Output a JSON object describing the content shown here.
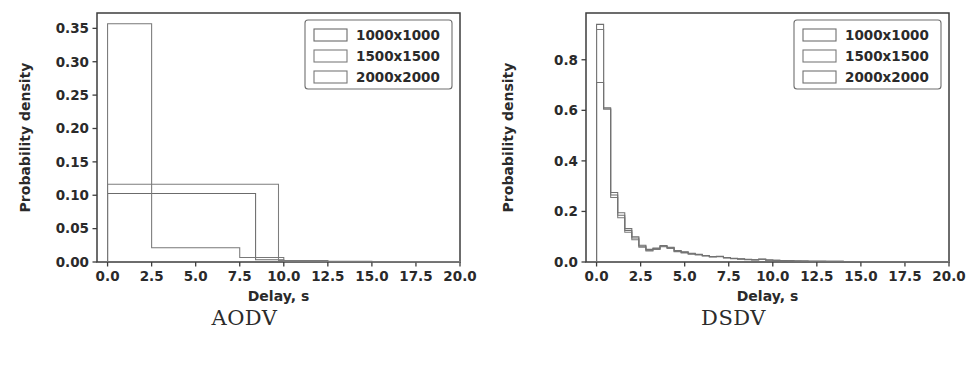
{
  "figure": {
    "background": "#ffffff",
    "panel_count": 2
  },
  "panels": [
    {
      "caption": "AODV",
      "chart_data": {
        "type": "line",
        "subtype": "step-histogram-outline",
        "title": "",
        "xlabel": "Delay, s",
        "ylabel": "Probability density",
        "xlim": [
          -0.6,
          20.0
        ],
        "ylim": [
          0.0,
          0.373
        ],
        "xticks": [
          0.0,
          2.5,
          5.0,
          7.5,
          10.0,
          12.5,
          15.0,
          17.5,
          20.0
        ],
        "xticklabels": [
          "0.0",
          "2.5",
          "5.0",
          "7.5",
          "10.0",
          "12.5",
          "15.0",
          "17.5",
          "20.0"
        ],
        "yticks": [
          0.0,
          0.05,
          0.1,
          0.15,
          0.2,
          0.25,
          0.3,
          0.35
        ],
        "yticklabels": [
          "0.00",
          "0.05",
          "0.10",
          "0.15",
          "0.20",
          "0.25",
          "0.30",
          "0.35"
        ],
        "grid": false,
        "legend_position": "upper right",
        "series": [
          {
            "name": "1000x1000",
            "color": "#6b6b6b",
            "bin_edges": [
              0.0,
              2.5,
              5.0,
              7.5,
              8.4,
              10.0,
              12.5,
              15.0,
              17.5,
              20.0
            ],
            "values": [
              0.1025,
              0.1025,
              0.1025,
              0.1025,
              0.0035,
              0.0012,
              0.0008,
              0.0005,
              0.0004
            ]
          },
          {
            "name": "1500x1500",
            "color": "#7d7d7d",
            "bin_edges": [
              0.0,
              2.5,
              5.0,
              7.5,
              9.7,
              10.0,
              12.5,
              15.0,
              17.5,
              20.0
            ],
            "values": [
              0.1165,
              0.1165,
              0.1165,
              0.1165,
              0.0022,
              0.0012,
              0.0008,
              0.0005,
              0.0003
            ]
          },
          {
            "name": "2000x2000",
            "color": "#787878",
            "bin_edges": [
              0.0,
              2.5,
              5.0,
              7.5,
              10.0,
              12.5,
              15.0,
              17.5,
              20.0
            ],
            "values": [
              0.357,
              0.0215,
              0.0215,
              0.0068,
              0.0022,
              0.0011,
              0.0007,
              0.0004
            ]
          }
        ]
      }
    },
    {
      "caption": "DSDV",
      "chart_data": {
        "type": "line",
        "subtype": "step-histogram-outline",
        "title": "",
        "xlabel": "Delay, s",
        "ylabel": "Probability density",
        "xlim": [
          -0.6,
          20.0
        ],
        "ylim": [
          0.0,
          0.985
        ],
        "xticks": [
          0.0,
          2.5,
          5.0,
          7.5,
          10.0,
          12.5,
          15.0,
          17.5,
          20.0
        ],
        "xticklabels": [
          "0.0",
          "2.5",
          "5.0",
          "7.5",
          "10.0",
          "12.5",
          "15.0",
          "17.5",
          "20.0"
        ],
        "yticks": [
          0.0,
          0.2,
          0.4,
          0.6,
          0.8
        ],
        "yticklabels": [
          "0.0",
          "0.2",
          "0.4",
          "0.6",
          "0.8"
        ],
        "grid": false,
        "legend_position": "upper right",
        "series": [
          {
            "name": "1000x1000",
            "color": "#6f6f6f",
            "bin_edges": [
              0.0,
              0.4,
              0.8,
              1.2,
              1.6,
              2.0,
              2.4,
              2.8,
              3.2,
              3.6,
              4.0,
              4.4,
              4.8,
              5.2,
              5.6,
              6.0,
              6.4,
              6.8,
              7.2,
              7.6,
              8.0,
              8.4,
              8.8,
              9.2,
              9.6,
              10.0,
              10.4,
              10.8,
              11.2,
              11.6,
              12.0,
              13.0,
              14.0,
              15.0,
              16.0,
              18.0,
              20.0
            ],
            "values": [
              0.94,
              0.61,
              0.265,
              0.185,
              0.125,
              0.095,
              0.062,
              0.047,
              0.052,
              0.062,
              0.056,
              0.043,
              0.038,
              0.033,
              0.03,
              0.025,
              0.021,
              0.022,
              0.017,
              0.014,
              0.012,
              0.01,
              0.009,
              0.011,
              0.008,
              0.007,
              0.006,
              0.005,
              0.004,
              0.004,
              0.003,
              0.003,
              0.002,
              0.002,
              0.001,
              0.001
            ]
          },
          {
            "name": "1500x1500",
            "color": "#7a7a7a",
            "bin_edges": [
              0.0,
              0.4,
              0.8,
              1.2,
              1.6,
              2.0,
              2.4,
              2.8,
              3.2,
              3.6,
              4.0,
              4.4,
              4.8,
              5.2,
              5.6,
              6.0,
              6.4,
              6.8,
              7.2,
              7.6,
              8.0,
              8.4,
              8.8,
              9.2,
              9.6,
              10.0,
              10.4,
              10.8,
              11.2,
              11.6,
              12.0,
              13.0,
              14.0,
              15.0,
              16.0,
              18.0,
              20.0
            ],
            "values": [
              0.92,
              0.605,
              0.255,
              0.175,
              0.118,
              0.088,
              0.058,
              0.044,
              0.05,
              0.06,
              0.054,
              0.041,
              0.036,
              0.031,
              0.028,
              0.024,
              0.02,
              0.021,
              0.016,
              0.013,
              0.011,
              0.009,
              0.008,
              0.01,
              0.007,
              0.006,
              0.005,
              0.005,
              0.004,
              0.003,
              0.003,
              0.002,
              0.002,
              0.001,
              0.001,
              0.001
            ]
          },
          {
            "name": "2000x2000",
            "color": "#727272",
            "bin_edges": [
              0.0,
              0.4,
              0.8,
              1.2,
              1.6,
              2.0,
              2.4,
              2.8,
              3.2,
              3.6,
              4.0,
              4.4,
              4.8,
              5.2,
              5.6,
              6.0,
              6.4,
              6.8,
              7.2,
              7.6,
              8.0,
              8.4,
              8.8,
              9.2,
              9.6,
              10.0,
              10.4,
              10.8,
              11.2,
              11.6,
              12.0,
              13.0,
              14.0,
              15.0,
              16.0,
              18.0,
              20.0
            ],
            "values": [
              0.71,
              0.605,
              0.275,
              0.195,
              0.132,
              0.1,
              0.066,
              0.05,
              0.055,
              0.065,
              0.058,
              0.045,
              0.04,
              0.035,
              0.031,
              0.026,
              0.022,
              0.023,
              0.018,
              0.015,
              0.013,
              0.011,
              0.009,
              0.012,
              0.008,
              0.007,
              0.006,
              0.005,
              0.004,
              0.004,
              0.003,
              0.003,
              0.002,
              0.002,
              0.001,
              0.001
            ]
          }
        ]
      }
    }
  ]
}
